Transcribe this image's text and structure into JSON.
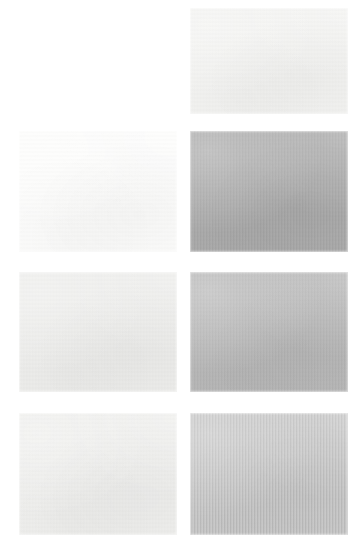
{
  "page": {
    "background_color": "#ffffff",
    "width": 358,
    "height": 556,
    "columns": 2,
    "rows": 4
  },
  "swatches": [
    {
      "id": "r1c1",
      "label": "",
      "row": 1,
      "column": 1,
      "present": false,
      "color": "#ffffff",
      "x": 19,
      "y": 8,
      "w": 158,
      "h": 106,
      "texture": "none"
    },
    {
      "id": "r1c2",
      "label": "",
      "row": 1,
      "column": 2,
      "present": true,
      "color": "#f2f2f0",
      "x": 190,
      "y": 8,
      "w": 158,
      "h": 106,
      "texture": "paper-grain"
    },
    {
      "id": "r2c1",
      "label": "",
      "row": 2,
      "column": 1,
      "present": true,
      "color": "#fcfcfb",
      "x": 19,
      "y": 131,
      "w": 158,
      "h": 121,
      "texture": "paper-grain"
    },
    {
      "id": "r2c2",
      "label": "",
      "row": 2,
      "column": 2,
      "present": true,
      "color": "#a6a6a6",
      "x": 190,
      "y": 131,
      "w": 158,
      "h": 121,
      "texture": "paper-grain"
    },
    {
      "id": "r3c1",
      "label": "",
      "row": 3,
      "column": 1,
      "present": true,
      "color": "#ececea",
      "x": 19,
      "y": 272,
      "w": 158,
      "h": 120,
      "texture": "paper-grain"
    },
    {
      "id": "r3c2",
      "label": "",
      "row": 3,
      "column": 2,
      "present": true,
      "color": "#b3b3b3",
      "x": 190,
      "y": 272,
      "w": 158,
      "h": 120,
      "texture": "paper-grain"
    },
    {
      "id": "r4c1",
      "label": "",
      "row": 4,
      "column": 1,
      "present": true,
      "color": "#eeeeec",
      "x": 19,
      "y": 413,
      "w": 158,
      "h": 122,
      "texture": "paper-grain"
    },
    {
      "id": "r4c2",
      "label": "",
      "row": 4,
      "column": 2,
      "present": true,
      "color": "#bcbcbc",
      "x": 190,
      "y": 413,
      "w": 158,
      "h": 122,
      "texture": "vertical-stripe"
    }
  ]
}
